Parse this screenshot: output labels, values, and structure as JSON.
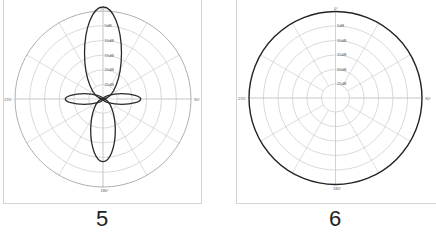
{
  "chart_data": [
    {
      "type": "polar",
      "id": "5",
      "caption": "5",
      "title": "",
      "angle_labels": [
        "0°",
        "90°",
        "180°",
        "270°"
      ],
      "radial_labels": [
        "5dB",
        "10dB",
        "15dB",
        "20dB",
        "25dB"
      ],
      "radial_rings": 5,
      "spoke_step_deg": 30,
      "grid": true,
      "pattern": "four-lobe (figure-8 with side lobes)",
      "lobes": [
        {
          "direction_deg": 0,
          "relative_length": 1.0,
          "relative_width": 0.21
        },
        {
          "direction_deg": 90,
          "relative_length": 0.41,
          "relative_width": 0.06
        },
        {
          "direction_deg": 180,
          "relative_length": 0.68,
          "relative_width": 0.14
        },
        {
          "direction_deg": 270,
          "relative_length": 0.41,
          "relative_width": 0.06
        }
      ]
    },
    {
      "type": "polar",
      "id": "6",
      "caption": "6",
      "title": "",
      "angle_labels": [
        "0°",
        "90°",
        "180°",
        "270°"
      ],
      "radial_labels": [
        "5dB",
        "10dB",
        "15dB",
        "20dB",
        "25dB"
      ],
      "radial_rings": 5,
      "spoke_step_deg": 30,
      "grid": true,
      "pattern": "omnidirectional",
      "relative_radius": 1.0
    }
  ],
  "captions": {
    "left": "5",
    "right": "6"
  }
}
